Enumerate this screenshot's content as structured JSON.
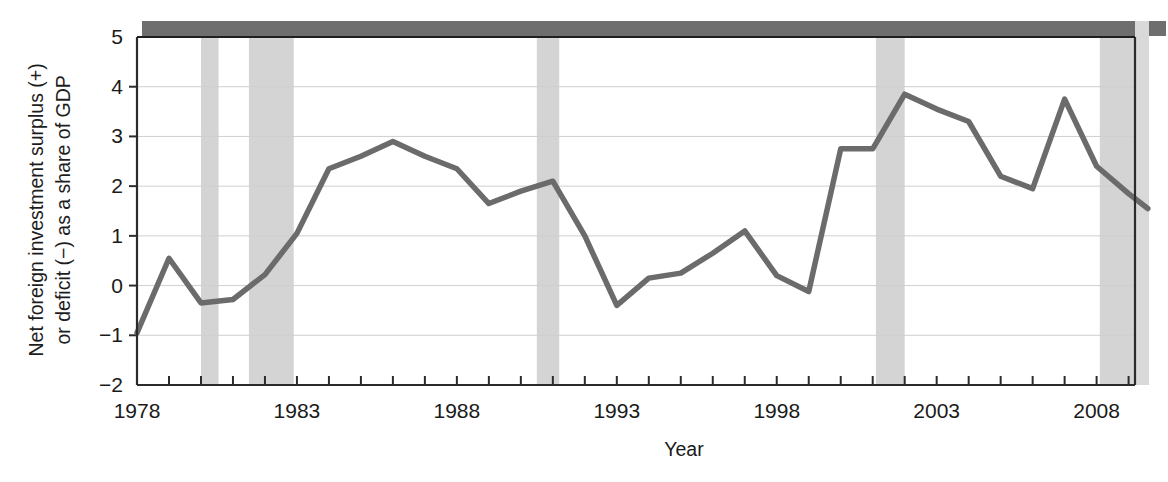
{
  "chart_data": {
    "type": "line",
    "title": "",
    "xlabel": "Year",
    "ylabel": "Net foreign investment surplus (+) or deficit (−) as a share of GDP",
    "ylabel_line1": "Net foreign investment surplus (+)",
    "ylabel_line2": "or deficit (−) as a share of GDP",
    "xlim": [
      1978,
      2009.2
    ],
    "ylim": [
      -2,
      5
    ],
    "ytick_values": [
      5,
      4,
      3,
      2,
      1,
      0,
      -1,
      -2
    ],
    "ytick_labels": [
      "5",
      "4",
      "3",
      "2",
      "1",
      "0",
      "−1",
      "−2"
    ],
    "xtick_every": 1,
    "xtick_labeled": [
      1978,
      1983,
      1988,
      1993,
      1998,
      2003,
      2008
    ],
    "xtick_labels": [
      "1978",
      "1983",
      "1988",
      "1993",
      "1998",
      "2003",
      "2008"
    ],
    "grid": "horizontal",
    "legend": "none",
    "series": [
      {
        "name": "Net foreign investment as a share of GDP",
        "color": "#6b6b6b",
        "x": [
          1978,
          1979,
          1980,
          1981,
          1982,
          1983,
          1984,
          1985,
          1986,
          1987,
          1988,
          1989,
          1990,
          1991,
          1992,
          1993,
          1994,
          1995,
          1996,
          1997,
          1998,
          1999,
          2000,
          2001,
          2002,
          2003,
          2004,
          2005,
          2006,
          2007,
          2008,
          2009
        ],
        "values": [
          -0.95,
          0.55,
          -0.35,
          -0.28,
          0.22,
          1.05,
          2.35,
          2.6,
          2.9,
          2.6,
          2.35,
          1.65,
          1.9,
          2.1,
          1.0,
          -0.4,
          0.15,
          0.25,
          0.65,
          1.1,
          0.2,
          -0.12,
          2.75,
          2.75,
          3.85,
          3.55,
          3.3,
          2.2,
          1.95,
          3.75,
          2.4,
          1.85
        ]
      }
    ],
    "last_point": {
      "x": 2009.6,
      "value": 1.55
    },
    "shaded_bands": [
      {
        "label": "recession-1980",
        "start": 1980.0,
        "end": 1980.55,
        "color": "#d4d4d4"
      },
      {
        "label": "recession-1981-82",
        "start": 1981.5,
        "end": 1982.9,
        "color": "#d4d4d4"
      },
      {
        "label": "recession-1990-91",
        "start": 1990.5,
        "end": 1991.2,
        "color": "#d4d4d4"
      },
      {
        "label": "recession-2001",
        "start": 2001.1,
        "end": 2002.0,
        "color": "#d4d4d4"
      },
      {
        "label": "recession-2007-09",
        "start": 2008.1,
        "end": 2009.6,
        "color": "#d4d4d4"
      }
    ],
    "top_band": {
      "label": "top-dark-band",
      "color": "#6e6e6e"
    },
    "axis_color": "#2b2b2b",
    "grid_color": "#cfcfcf",
    "line_color": "#6b6b6b",
    "band_color": "#d4d4d4"
  }
}
